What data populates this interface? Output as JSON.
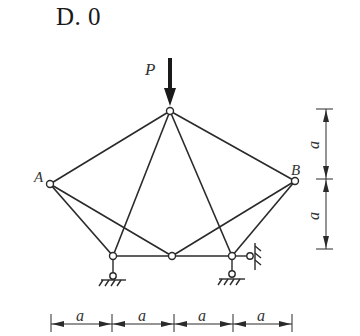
{
  "option": {
    "label": "D. 0"
  },
  "diagram": {
    "type": "truss",
    "load": {
      "label": "P",
      "direction": "down",
      "applied_at": "top-node"
    },
    "nodes": {
      "top": [
        170,
        111
      ],
      "A": [
        50,
        184
      ],
      "B": [
        295,
        181
      ],
      "bottom_left": [
        113,
        256
      ],
      "bottom_middle": [
        172,
        256
      ],
      "bottom_right": [
        232,
        256
      ]
    },
    "node_labels": {
      "A": "A",
      "B": "B"
    },
    "members": [
      [
        "top",
        "A"
      ],
      [
        "top",
        "B"
      ],
      [
        "top",
        "bottom_left"
      ],
      [
        "top",
        "bottom_right"
      ],
      [
        "A",
        "bottom_left"
      ],
      [
        "A",
        "bottom_middle"
      ],
      [
        "B",
        "bottom_middle"
      ],
      [
        "B",
        "bottom_right"
      ],
      [
        "bottom_left",
        "bottom_middle"
      ],
      [
        "bottom_middle",
        "bottom_right"
      ]
    ],
    "supports": [
      {
        "node": "bottom_left",
        "type": "vertical-link"
      },
      {
        "node": "bottom_right",
        "type": "vertical-link"
      },
      {
        "node": "bottom_right",
        "type": "horizontal-link"
      }
    ],
    "dimensions": {
      "horizontal": [
        "a",
        "a",
        "a",
        "a"
      ],
      "vertical": [
        "a",
        "a"
      ]
    },
    "colors": {
      "line": "#2a2a2a",
      "text": "#333333"
    }
  }
}
